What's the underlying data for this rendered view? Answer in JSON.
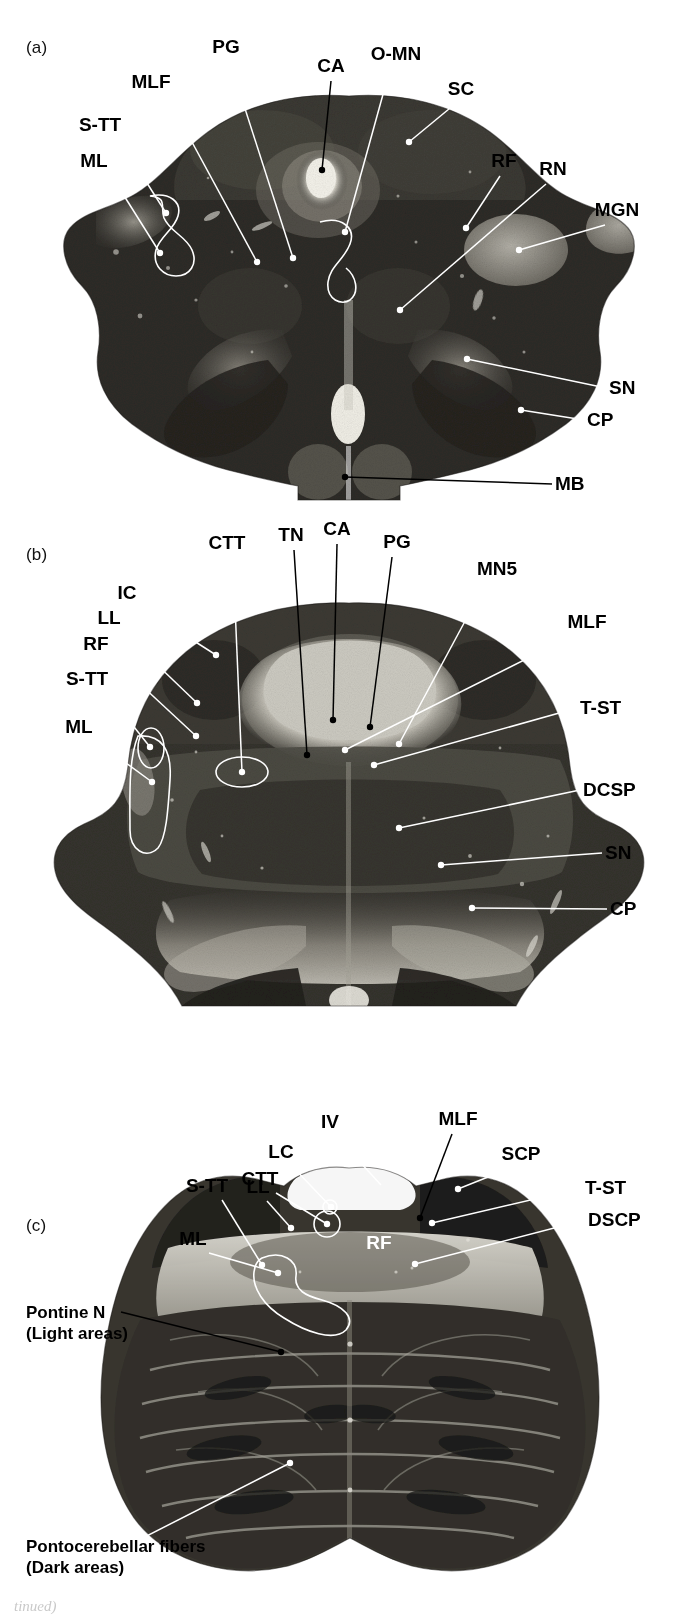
{
  "figure": {
    "kind": "anatomical-plate",
    "footer_text": "tinued)"
  },
  "panels": [
    {
      "id": "a",
      "letter": "(a)",
      "section_name": "Midbrain at level of superior colliculus",
      "labels": [
        {
          "text": "PG",
          "x": 226,
          "y": 53,
          "anchor": "middle",
          "color": "black",
          "line": [
            [
              230,
              62
            ],
            [
              293,
              258
            ]
          ],
          "tip": "dot-white"
        },
        {
          "text": "CA",
          "x": 331,
          "y": 72,
          "anchor": "middle",
          "color": "black",
          "line": [
            [
              331,
              81
            ],
            [
              322,
              170
            ]
          ],
          "tip": "dot-black"
        },
        {
          "text": "O-MN",
          "x": 396,
          "y": 60,
          "anchor": "middle",
          "color": "black",
          "line": [
            [
              390,
              69
            ],
            [
              345,
              232
            ]
          ],
          "tip": "dot-white"
        },
        {
          "text": "SC",
          "x": 461,
          "y": 95,
          "anchor": "middle",
          "color": "black",
          "line": [
            [
              455,
              104
            ],
            [
              409,
              142
            ]
          ],
          "tip": "dot-white"
        },
        {
          "text": "MLF",
          "x": 151,
          "y": 88,
          "anchor": "middle",
          "color": "black",
          "line": [
            [
              167,
              96
            ],
            [
              257,
              262
            ]
          ],
          "tip": "dot-white"
        },
        {
          "text": "S-TT",
          "x": 100,
          "y": 131,
          "anchor": "middle",
          "color": "black",
          "line": [
            [
              119,
              139
            ],
            [
              166,
              213
            ]
          ],
          "tip": "dot-white"
        },
        {
          "text": "ML",
          "x": 94,
          "y": 167,
          "anchor": "middle",
          "color": "black",
          "line": [
            [
              111,
              175
            ],
            [
              160,
              253
            ]
          ],
          "tip": "dot-white"
        },
        {
          "text": "RF",
          "x": 504,
          "y": 167,
          "anchor": "middle",
          "color": "black",
          "line": [
            [
              500,
              176
            ],
            [
              466,
              228
            ]
          ],
          "tip": "dot-white"
        },
        {
          "text": "RN",
          "x": 553,
          "y": 175,
          "anchor": "middle",
          "color": "black",
          "line": [
            [
              546,
              184
            ],
            [
              400,
              310
            ]
          ],
          "tip": "dot-white"
        },
        {
          "text": "MGN",
          "x": 617,
          "y": 216,
          "anchor": "middle",
          "color": "black",
          "line": [
            [
              605,
              225
            ],
            [
              519,
              250
            ]
          ],
          "tip": "dot-white"
        },
        {
          "text": "SN",
          "x": 609,
          "y": 394,
          "anchor": "start",
          "color": "black",
          "line": [
            [
              606,
              388
            ],
            [
              467,
              359
            ]
          ],
          "tip": "dot-white"
        },
        {
          "text": "CP",
          "x": 587,
          "y": 426,
          "anchor": "start",
          "color": "black",
          "line": [
            [
              584,
              420
            ],
            [
              521,
              410
            ]
          ],
          "tip": "dot-white"
        },
        {
          "text": "MB",
          "x": 555,
          "y": 490,
          "anchor": "start",
          "color": "black",
          "line": [
            [
              552,
              484
            ],
            [
              345,
              477
            ]
          ],
          "tip": "dot-black"
        }
      ]
    },
    {
      "id": "b",
      "letter": "(b)",
      "section_name": "Upper pons at level of inferior colliculus / trochlear nucleus",
      "labels": [
        {
          "text": "CTT",
          "x": 227,
          "y": 549,
          "anchor": "middle",
          "color": "black",
          "line": [
            [
              233,
              558
            ],
            [
              242,
              772
            ]
          ],
          "tip": "dot-white",
          "ring": [
            242,
            772,
            26,
            15
          ]
        },
        {
          "text": "TN",
          "x": 291,
          "y": 541,
          "anchor": "middle",
          "color": "black",
          "line": [
            [
              294,
              550
            ],
            [
              307,
              755
            ]
          ],
          "tip": "dot-black"
        },
        {
          "text": "CA",
          "x": 337,
          "y": 535,
          "anchor": "middle",
          "color": "black",
          "line": [
            [
              337,
              544
            ],
            [
              333,
              720
            ]
          ],
          "tip": "dot-black"
        },
        {
          "text": "PG",
          "x": 397,
          "y": 548,
          "anchor": "middle",
          "color": "black",
          "line": [
            [
              392,
              557
            ],
            [
              370,
              727
            ]
          ],
          "tip": "dot-black"
        },
        {
          "text": "MN5",
          "x": 497,
          "y": 575,
          "anchor": "middle",
          "color": "black",
          "line": [
            [
              485,
              584
            ],
            [
              399,
              744
            ]
          ],
          "tip": "dot-white"
        },
        {
          "text": "MLF",
          "x": 587,
          "y": 628,
          "anchor": "middle",
          "color": "black",
          "line": [
            [
              572,
              636
            ],
            [
              345,
              750
            ]
          ],
          "tip": "dot-white"
        },
        {
          "text": "IC",
          "x": 127,
          "y": 599,
          "anchor": "middle",
          "color": "black",
          "line": [
            [
              141,
              607
            ],
            [
              216,
              655
            ]
          ],
          "tip": "dot-white"
        },
        {
          "text": "LL",
          "x": 109,
          "y": 624,
          "anchor": "middle",
          "color": "black",
          "line": [
            [
              123,
              632
            ],
            [
              197,
              703
            ]
          ],
          "tip": "dot-white"
        },
        {
          "text": "RF",
          "x": 96,
          "y": 650,
          "anchor": "middle",
          "color": "black",
          "line": [
            [
              112,
              658
            ],
            [
              196,
              736
            ]
          ],
          "tip": "dot-white"
        },
        {
          "text": "S-TT",
          "x": 87,
          "y": 685,
          "anchor": "middle",
          "color": "black",
          "line": [
            [
              107,
              693
            ],
            [
              150,
              747
            ]
          ],
          "tip": "dot-white"
        },
        {
          "text": "ML",
          "x": 79,
          "y": 733,
          "anchor": "middle",
          "color": "black",
          "line": [
            [
              96,
              741
            ],
            [
              152,
              782
            ]
          ],
          "tip": "dot-white"
        },
        {
          "text": "T-ST",
          "x": 580,
          "y": 714,
          "anchor": "start",
          "color": "black",
          "line": [
            [
              577,
              708
            ],
            [
              374,
              765
            ]
          ],
          "tip": "dot-white"
        },
        {
          "text": "DCSP",
          "x": 583,
          "y": 796,
          "anchor": "start",
          "color": "black",
          "line": [
            [
              580,
              790
            ],
            [
              399,
              828
            ]
          ],
          "tip": "dot-white"
        },
        {
          "text": "SN",
          "x": 605,
          "y": 859,
          "anchor": "start",
          "color": "black",
          "line": [
            [
              602,
              853
            ],
            [
              441,
              865
            ]
          ],
          "tip": "dot-white"
        },
        {
          "text": "CP",
          "x": 610,
          "y": 915,
          "anchor": "start",
          "color": "black",
          "line": [
            [
              607,
              909
            ],
            [
              472,
              908
            ]
          ],
          "tip": "dot-white"
        }
      ]
    },
    {
      "id": "c",
      "letter": "(c)",
      "section_name": "Mid pons at level of the fourth ventricle",
      "labels": [
        {
          "text": "IV",
          "x": 330,
          "y": 1128,
          "anchor": "middle",
          "color": "black",
          "line": [
            [
              337,
              1137
            ],
            [
              381,
              1185
            ]
          ],
          "tip": "none"
        },
        {
          "text": "MLF",
          "x": 458,
          "y": 1125,
          "anchor": "middle",
          "color": "black",
          "line": [
            [
              452,
              1134
            ],
            [
              420,
              1218
            ]
          ],
          "tip": "dot-black"
        },
        {
          "text": "LC",
          "x": 281,
          "y": 1158,
          "anchor": "middle",
          "color": "black",
          "line": [
            [
              292,
              1166
            ],
            [
              331,
              1207
            ]
          ],
          "tip": "dot-white",
          "ring": [
            330,
            1207,
            7,
            7
          ]
        },
        {
          "text": "CTT",
          "x": 260,
          "y": 1185,
          "anchor": "middle",
          "color": "black",
          "line": [
            [
              276,
              1193
            ],
            [
              327,
              1224
            ]
          ],
          "tip": "dot-white",
          "ring": [
            327,
            1224,
            13,
            13
          ]
        },
        {
          "text": "SCP",
          "x": 521,
          "y": 1160,
          "anchor": "middle",
          "color": "black",
          "line": [
            [
              508,
              1169
            ],
            [
              458,
              1189
            ]
          ],
          "tip": "dot-white"
        },
        {
          "text": "T-ST",
          "x": 585,
          "y": 1194,
          "anchor": "start",
          "color": "black",
          "line": [
            [
              582,
              1188
            ],
            [
              432,
              1223
            ]
          ],
          "tip": "dot-white"
        },
        {
          "text": "S-TT",
          "x": 207,
          "y": 1192,
          "anchor": "middle",
          "color": "black",
          "line": [
            [
              222,
              1200
            ],
            [
              262,
              1265
            ]
          ],
          "tip": "dot-white"
        },
        {
          "text": "LL",
          "x": 258,
          "y": 1193,
          "anchor": "middle",
          "color": "black",
          "line": [
            [
              267,
              1201
            ],
            [
              291,
              1228
            ]
          ],
          "tip": "dot-white"
        },
        {
          "text": "DSCP",
          "x": 588,
          "y": 1226,
          "anchor": "start",
          "color": "black",
          "line": [
            [
              585,
              1220
            ],
            [
              415,
              1264
            ]
          ],
          "tip": "dot-white"
        },
        {
          "text": "ML",
          "x": 193,
          "y": 1245,
          "anchor": "middle",
          "color": "black",
          "line": [
            [
              209,
              1253
            ],
            [
              278,
              1273
            ]
          ],
          "tip": "dot-white"
        },
        {
          "text": "RF",
          "x": 379,
          "y": 1249,
          "anchor": "middle",
          "color": "white",
          "line": null,
          "tip": "none"
        }
      ],
      "block_labels": [
        {
          "lines": [
            "Pontine N",
            "(Light areas)"
          ],
          "x": 26,
          "y": 1318,
          "line": [
            [
              121,
              1312
            ],
            [
              281,
              1352
            ]
          ],
          "tip": "dot-black"
        },
        {
          "lines": [
            "Pontocerebellar fibers",
            "(Dark areas)"
          ],
          "x": 26,
          "y": 1552,
          "line": [
            [
              127,
              1546
            ],
            [
              290,
              1463
            ]
          ],
          "tip": "dot-white"
        }
      ]
    }
  ],
  "abbreviations": {
    "PG": "Periaqueductal gray",
    "CA": "Cerebral aqueduct",
    "O-MN": "Oculomotor nucleus",
    "SC": "Superior colliculus",
    "MLF": "Medial longitudinal fasciculus",
    "S-TT": "Spinal trigeminal tract",
    "ML": "Medial lemniscus",
    "RF": "Reticular formation",
    "RN": "Red nucleus",
    "MGN": "Medial geniculate nucleus",
    "SN": "Substantia nigra",
    "CP": "Cerebral peduncle",
    "MB": "Mammillary body",
    "CTT": "Central tegmental tract",
    "TN": "Trochlear nucleus",
    "MN5": "Motor nucleus of V",
    "IC": "Inferior colliculus",
    "LL": "Lateral lemniscus",
    "T-ST": "Tectospinal tract",
    "DCSP": "Decussation of superior cerebellar peduncle",
    "IV": "Fourth ventricle",
    "LC": "Locus ceruleus",
    "SCP": "Superior cerebellar peduncle",
    "DSCP": "Dorsal spinocerebellar pathway"
  }
}
